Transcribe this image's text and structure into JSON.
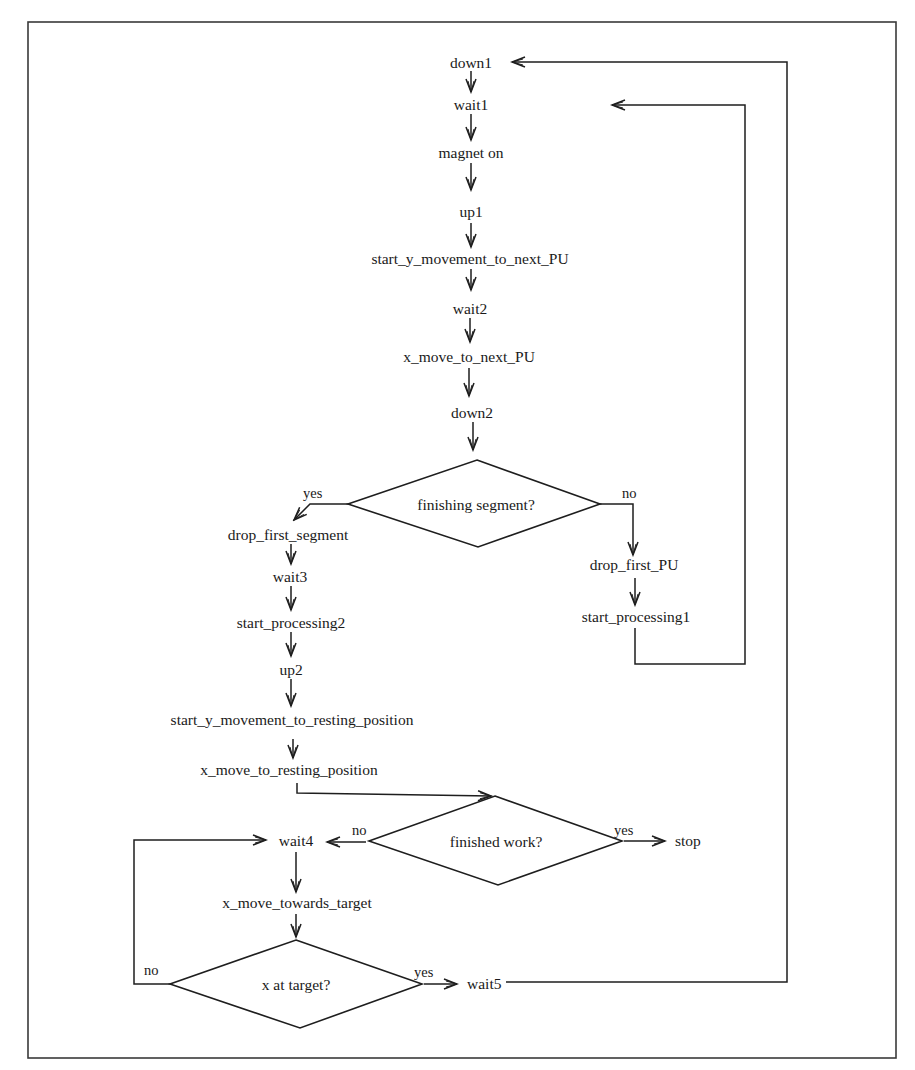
{
  "diagram": {
    "type": "flowchart",
    "nodes": {
      "down1": "down1",
      "wait1": "wait1",
      "magnet_on": "magnet on",
      "up1": "up1",
      "start_y_next": "start_y_movement_to_next_PU",
      "wait2": "wait2",
      "x_move_next": "x_move_to_next_PU",
      "down2": "down2",
      "drop_first_segment": "drop_first_segment",
      "wait3": "wait3",
      "start_processing2": "start_processing2",
      "up2": "up2",
      "start_y_resting": "start_y_movement_to_resting_position",
      "x_move_resting": "x_move_to_resting_position",
      "drop_first_PU": "drop_first_PU",
      "start_processing1": "start_processing1",
      "wait4": "wait4",
      "x_move_towards": "x_move_towards_target",
      "wait5": "wait5",
      "stop": "stop"
    },
    "decisions": {
      "finishing_segment": "finishing segment?",
      "finished_work": "finished work?",
      "x_at_target": "x at target?"
    },
    "edge_labels": {
      "finishing_yes": "yes",
      "finishing_no": "no",
      "finished_no": "no",
      "finished_yes": "yes",
      "target_no": "no",
      "target_yes": "yes"
    },
    "edges": [
      [
        "down1",
        "wait1"
      ],
      [
        "wait1",
        "magnet_on"
      ],
      [
        "magnet_on",
        "up1"
      ],
      [
        "up1",
        "start_y_next"
      ],
      [
        "start_y_next",
        "wait2"
      ],
      [
        "wait2",
        "x_move_next"
      ],
      [
        "x_move_next",
        "down2"
      ],
      [
        "down2",
        "finishing_segment"
      ],
      [
        "finishing_segment",
        "drop_first_segment",
        "yes"
      ],
      [
        "finishing_segment",
        "drop_first_PU",
        "no"
      ],
      [
        "drop_first_PU",
        "start_processing1"
      ],
      [
        "start_processing1",
        "wait1"
      ],
      [
        "drop_first_segment",
        "wait3"
      ],
      [
        "wait3",
        "start_processing2"
      ],
      [
        "start_processing2",
        "up2"
      ],
      [
        "up2",
        "start_y_resting"
      ],
      [
        "start_y_resting",
        "x_move_resting"
      ],
      [
        "x_move_resting",
        "finished_work"
      ],
      [
        "finished_work",
        "wait4",
        "no"
      ],
      [
        "finished_work",
        "stop",
        "yes"
      ],
      [
        "wait4",
        "x_move_towards"
      ],
      [
        "x_move_towards",
        "x_at_target"
      ],
      [
        "x_at_target",
        "wait4",
        "no"
      ],
      [
        "x_at_target",
        "wait5",
        "yes"
      ],
      [
        "wait5",
        "down1"
      ]
    ]
  }
}
